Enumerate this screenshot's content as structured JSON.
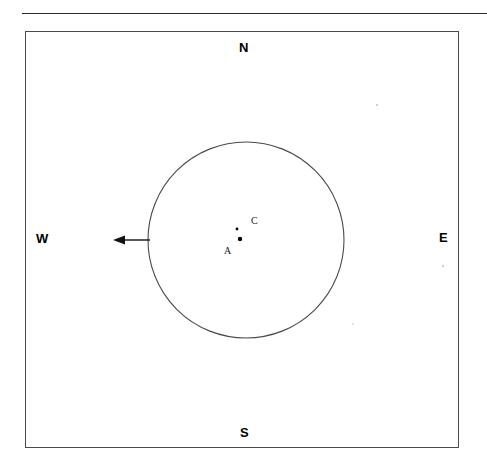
{
  "diagram": {
    "type": "geometry-sketch",
    "colors": {
      "stroke": "#4a4a4a",
      "rule": "#2b2b2b",
      "text": "#000000",
      "point": "#000000",
      "background": "#ffffff"
    },
    "rule": {
      "name": "top-horizontal-rule",
      "x1": 22,
      "x2": 487,
      "y": 13
    },
    "field_box": {
      "name": "field-boundary",
      "x": 25,
      "y": 31,
      "width": 434,
      "height": 417
    },
    "compass": {
      "north_label": "N",
      "south_label": "S",
      "west_label": "W",
      "east_label": "E"
    },
    "circle": {
      "name": "main-circle",
      "center_x": 246,
      "center_y": 240,
      "radius": 98
    },
    "points": [
      {
        "id": "A",
        "label": "A",
        "x": 240,
        "y": 239,
        "radius": 2.2,
        "label_x": 224,
        "label_y": 246
      },
      {
        "id": "C",
        "label": "C",
        "x": 237,
        "y": 229,
        "radius": 1.4,
        "label_x": 251,
        "label_y": 216
      }
    ],
    "arrow": {
      "name": "west-pointing-arrow",
      "direction": "west",
      "tail_x": 150,
      "tail_y": 240,
      "head_x": 113,
      "head_y": 240
    }
  }
}
